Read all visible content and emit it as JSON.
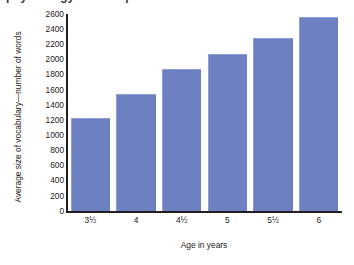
{
  "figure": {
    "cropped_title": "psychology · development",
    "bar_color": "#6c80c2",
    "bar_edge_color": "#8d9ed4",
    "axis_color": "#231f20",
    "background_color": "#ffffff"
  },
  "chart_data": {
    "type": "bar",
    "title": "",
    "xlabel": "Age in years",
    "ylabel": "Average size of vocabulary—number of words",
    "categories": [
      "3½",
      "4",
      "4½",
      "5",
      "5½",
      "6"
    ],
    "values": [
      1222,
      1540,
      1870,
      2072,
      2289,
      2562
    ],
    "ylim": [
      0,
      2600
    ],
    "ytick_values": [
      2600,
      2400,
      2200,
      2000,
      1800,
      1600,
      1400,
      1200,
      1000,
      800,
      600,
      400,
      200,
      0
    ],
    "ytick_labels": [
      "2600",
      "2400",
      "2200",
      "2000",
      "1800",
      "1600",
      "1400",
      "1200",
      "1000",
      "800",
      "600",
      "400",
      "200",
      "0"
    ],
    "grid": false,
    "legend": null,
    "legend_position": "none",
    "series": [
      {
        "name": "Average vocabulary size",
        "values": [
          1222,
          1540,
          1870,
          2072,
          2289,
          2562
        ]
      }
    ]
  }
}
